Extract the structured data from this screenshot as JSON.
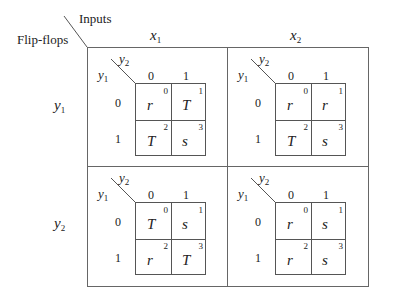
{
  "header": {
    "corner_row_label": "Flip-flops",
    "corner_col_label": "Inputs"
  },
  "columns": [
    {
      "var": "x",
      "sub": "1"
    },
    {
      "var": "x",
      "sub": "2"
    }
  ],
  "rows": [
    {
      "var": "y",
      "sub": "1"
    },
    {
      "var": "y",
      "sub": "2"
    }
  ],
  "kmap_axes": {
    "col_var": "y",
    "col_sub": "2",
    "row_var": "y",
    "row_sub": "1",
    "col_values": [
      "0",
      "1"
    ],
    "row_values": [
      "0",
      "1"
    ]
  },
  "maps": [
    {
      "row": "y1",
      "col": "x1",
      "cells": [
        {
          "value": "r",
          "index": "0"
        },
        {
          "value": "T",
          "index": "1"
        },
        {
          "value": "T",
          "index": "2"
        },
        {
          "value": "s",
          "index": "3"
        }
      ]
    },
    {
      "row": "y1",
      "col": "x2",
      "cells": [
        {
          "value": "r",
          "index": "0"
        },
        {
          "value": "r",
          "index": "1"
        },
        {
          "value": "T",
          "index": "2"
        },
        {
          "value": "s",
          "index": "3"
        }
      ]
    },
    {
      "row": "y2",
      "col": "x1",
      "cells": [
        {
          "value": "T",
          "index": "0"
        },
        {
          "value": "s",
          "index": "1"
        },
        {
          "value": "r",
          "index": "2"
        },
        {
          "value": "T",
          "index": "3"
        }
      ]
    },
    {
      "row": "y2",
      "col": "x2",
      "cells": [
        {
          "value": "r",
          "index": "0"
        },
        {
          "value": "s",
          "index": "1"
        },
        {
          "value": "r",
          "index": "2"
        },
        {
          "value": "s",
          "index": "3"
        }
      ]
    }
  ]
}
